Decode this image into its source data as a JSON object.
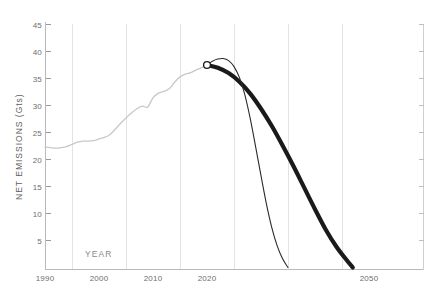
{
  "chart_data": {
    "type": "line",
    "title": "",
    "subtitle": "",
    "xlabel": "YEAR",
    "ylabel": "NET EMISSIONS (Gts)",
    "xlim": [
      1990,
      2052
    ],
    "ylim": [
      0,
      46
    ],
    "grid": "vertical-only",
    "legend": "none",
    "x_ticks": [
      1990,
      2000,
      2010,
      2020,
      2050
    ],
    "x_tick_labels": [
      "1990",
      "2000",
      "2010",
      "2020",
      "2050"
    ],
    "y_ticks": [
      5,
      10,
      15,
      20,
      25,
      30,
      35,
      40,
      45
    ],
    "y_tick_labels": [
      "5",
      "10",
      "15",
      "20",
      "25",
      "30",
      "35",
      "40",
      "45"
    ],
    "gridline_years": [
      1995,
      2005,
      2015,
      2025,
      2035,
      2045
    ],
    "right_axis": {
      "visible": true,
      "labels_shown": false,
      "tick_count": 9
    },
    "annotations": [
      {
        "name": "present-day-marker",
        "type": "open-circle",
        "x": 2020,
        "y": 37.5,
        "label": ""
      }
    ],
    "series": [
      {
        "name": "historical-emissions",
        "style": "thin-light-gray",
        "color": "#c8c8c8",
        "x": [
          1990,
          1991,
          1992,
          1993,
          1994,
          1995,
          1996,
          1997,
          1998,
          1999,
          2000,
          2001,
          2002,
          2003,
          2004,
          2005,
          2006,
          2007,
          2008,
          2009,
          2010,
          2011,
          2012,
          2013,
          2014,
          2015,
          2016,
          2017,
          2018,
          2019,
          2020
        ],
        "values": [
          22.3,
          22.2,
          22.1,
          22.2,
          22.4,
          22.8,
          23.2,
          23.4,
          23.4,
          23.5,
          23.8,
          24.1,
          24.6,
          25.6,
          26.7,
          27.7,
          28.6,
          29.4,
          29.9,
          29.7,
          31.4,
          32.3,
          32.6,
          33.1,
          34.3,
          35.3,
          35.8,
          36.1,
          36.6,
          37.0,
          37.5
        ]
      },
      {
        "name": "steep-decline-pathway",
        "style": "thin-black",
        "color": "#2b2b2b",
        "x": [
          2020,
          2021,
          2022,
          2023,
          2024,
          2025,
          2026,
          2027,
          2028,
          2029,
          2030,
          2031,
          2032,
          2033,
          2034,
          2035
        ],
        "values": [
          37.5,
          38.2,
          38.6,
          38.7,
          38.3,
          37.2,
          35.2,
          32.0,
          27.6,
          22.4,
          17.0,
          11.8,
          7.4,
          4.0,
          1.6,
          0.0
        ]
      },
      {
        "name": "gradual-decline-pathway",
        "style": "thick-black",
        "color": "#1a1a1a",
        "x": [
          2020,
          2022,
          2024,
          2026,
          2028,
          2030,
          2032,
          2034,
          2036,
          2038,
          2040,
          2042,
          2044,
          2046,
          2047
        ],
        "values": [
          37.5,
          37.0,
          36.0,
          34.4,
          32.2,
          29.4,
          26.2,
          22.6,
          18.8,
          14.8,
          10.8,
          7.0,
          3.8,
          1.2,
          0.0
        ]
      }
    ]
  }
}
